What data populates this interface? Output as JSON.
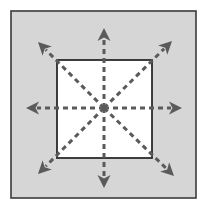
{
  "figure": {
    "type": "diagram",
    "canvas": {
      "width": 207,
      "height": 209,
      "background_color": "#ffffff"
    },
    "frame": {
      "name": "outer-frame",
      "x": 11,
      "y": 11,
      "width": 185,
      "height": 187,
      "fill_color": "#d6d6d6",
      "stroke_color": "#3a3a3a",
      "stroke_width": 1.6
    },
    "square": {
      "name": "inner-square",
      "x": 57,
      "y": 60,
      "width": 95,
      "height": 98,
      "fill_color": "#ffffff",
      "stroke_color": "#2b2b2b",
      "stroke_width": 1.8
    },
    "center_point": {
      "x": 104,
      "y": 108,
      "label": ""
    },
    "line_style": {
      "stroke_color": "#5a5a5a",
      "stroke_width": 3,
      "dash_length": 5,
      "gap_length": 4
    },
    "arrowhead": {
      "fill_color": "#5a5a5a",
      "length": 13,
      "half_width": 6.5,
      "notch": 3.5
    },
    "arrows": [
      {
        "name": "arrow-up",
        "direction": "up",
        "angle_deg": 270,
        "tip_x": 104,
        "tip_y": 28
      },
      {
        "name": "arrow-down",
        "direction": "down",
        "angle_deg": 90,
        "tip_x": 104,
        "tip_y": 188
      },
      {
        "name": "arrow-left",
        "direction": "left",
        "angle_deg": 180,
        "tip_x": 26,
        "tip_y": 108
      },
      {
        "name": "arrow-right",
        "direction": "right",
        "angle_deg": 0,
        "tip_x": 182,
        "tip_y": 108
      },
      {
        "name": "arrow-up-left",
        "direction": "up-left",
        "angle_deg": 225,
        "tip_x": 38,
        "tip_y": 42
      },
      {
        "name": "arrow-up-right",
        "direction": "up-right",
        "angle_deg": 315,
        "tip_x": 172,
        "tip_y": 41
      },
      {
        "name": "arrow-down-left",
        "direction": "down-left",
        "angle_deg": 135,
        "tip_x": 38,
        "tip_y": 174
      },
      {
        "name": "arrow-down-right",
        "direction": "down-right",
        "angle_deg": 45,
        "tip_x": 174,
        "tip_y": 176
      }
    ],
    "labels": []
  }
}
